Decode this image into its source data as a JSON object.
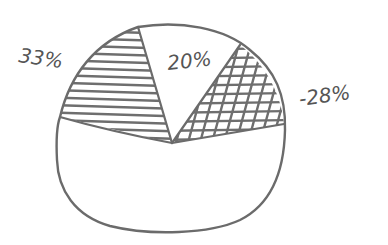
{
  "chart_data": {
    "type": "pie",
    "title": "",
    "style": "hand-drawn sketch",
    "slices": [
      {
        "label": "33%",
        "value": 33,
        "fill": "horizontal-hatch",
        "color": "#6e6e6e"
      },
      {
        "label": "20%",
        "value": 20,
        "fill": "none",
        "color": "#ffffff"
      },
      {
        "label": "-28%",
        "value": 28,
        "fill": "cross-hatch",
        "color": "#6e6e6e"
      },
      {
        "label": "",
        "value": 19,
        "fill": "none",
        "color": "#ffffff"
      }
    ],
    "legend": "none",
    "label_placement": "outside-and-inside"
  }
}
